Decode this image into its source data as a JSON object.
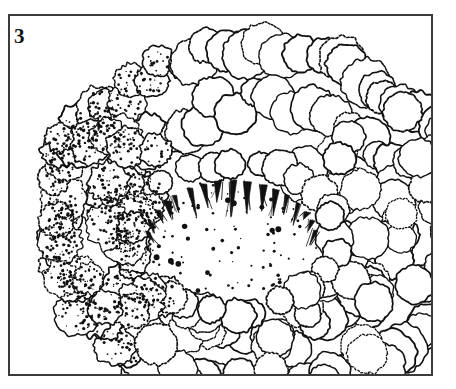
{
  "figure": {
    "panel_label": "3",
    "caption_visible": "",
    "medium": "black-ink-line-drawing-with-stipple",
    "frame": {
      "x": 8,
      "y": 14,
      "width": 425,
      "height": 362,
      "border_color": "#3b3b3b",
      "border_width": 2,
      "background_color": "#ffffff"
    },
    "canvas": {
      "width": 456,
      "height": 389,
      "background_color": "#ffffff"
    },
    "ink_color": "#111111",
    "label_color": "#131313"
  },
  "drawing": {
    "description": "Dome-shaped mass of densely packed rounded florets forming a hemispherical curd, open at lower-left-of-centre where a shallow central cavity exposes radiating tapered pedicels and dense stippling.",
    "central_cavity": {
      "center_x": 232,
      "center_y": 238,
      "radius_x": 92,
      "radius_y": 62,
      "stipple_dot_count": 96
    },
    "floret_counts": {
      "outer_ring": 74,
      "mid_ring": 46,
      "inner_rim": 28,
      "stippled_left_cluster": 22
    },
    "pedicels": {
      "count": 17,
      "origin_arc_start_deg": 188,
      "origin_arc_end_deg": 352,
      "length_min": 14,
      "length_max": 38
    }
  }
}
